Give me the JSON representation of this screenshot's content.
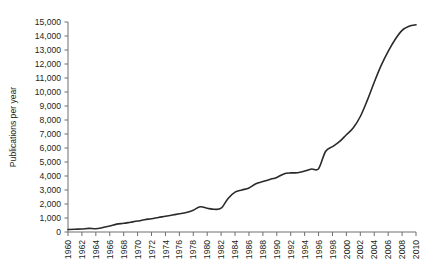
{
  "chart_data": {
    "type": "line",
    "title": "",
    "subtitle": "",
    "xlabel": "",
    "ylabel": "Publications per year",
    "xlim": [
      1960,
      2010
    ],
    "ylim": [
      0,
      15000
    ],
    "ytick_step": 1000,
    "xtick_step": 2,
    "grid": false,
    "legend": false,
    "legend_position": "none",
    "line_color": "#2a2a2a",
    "ytick_labels": [
      "0",
      "1,000",
      "2,000",
      "3,000",
      "4,000",
      "5,000",
      "6,000",
      "7,000",
      "8,000",
      "9,000",
      "10,000",
      "11,000",
      "12,000",
      "13,000",
      "14,000",
      "15,000"
    ],
    "xtick_labels": [
      "1960",
      "1962",
      "1964",
      "1966",
      "1968",
      "1970",
      "1972",
      "1974",
      "1976",
      "1978",
      "1980",
      "1982",
      "1984",
      "1986",
      "1988",
      "1990",
      "1992",
      "1994",
      "1996",
      "1998",
      "2000",
      "2002",
      "2004",
      "2006",
      "2008",
      "2010"
    ],
    "x": [
      1960,
      1961,
      1962,
      1963,
      1964,
      1965,
      1966,
      1967,
      1968,
      1969,
      1970,
      1971,
      1972,
      1973,
      1974,
      1975,
      1976,
      1977,
      1978,
      1979,
      1980,
      1981,
      1982,
      1983,
      1984,
      1985,
      1986,
      1987,
      1988,
      1989,
      1990,
      1991,
      1992,
      1993,
      1994,
      1995,
      1996,
      1997,
      1998,
      1999,
      2000,
      2001,
      2002,
      2003,
      2004,
      2005,
      2006,
      2007,
      2008,
      2009,
      2010
    ],
    "values": [
      180,
      200,
      210,
      260,
      230,
      320,
      430,
      560,
      620,
      700,
      780,
      880,
      950,
      1040,
      1120,
      1210,
      1300,
      1400,
      1560,
      1800,
      1700,
      1620,
      1700,
      2400,
      2850,
      3000,
      3150,
      3450,
      3600,
      3750,
      3900,
      4150,
      4220,
      4230,
      4350,
      4500,
      4520,
      5750,
      6100,
      6450,
      6950,
      7450,
      8250,
      9400,
      10700,
      11900,
      12900,
      13750,
      14400,
      14700,
      14800
    ],
    "series": [
      {
        "name": "Publications per year",
        "values": [
          180,
          200,
          210,
          260,
          230,
          320,
          430,
          560,
          620,
          700,
          780,
          880,
          950,
          1040,
          1120,
          1210,
          1300,
          1400,
          1560,
          1800,
          1700,
          1620,
          1700,
          2400,
          2850,
          3000,
          3150,
          3450,
          3600,
          3750,
          3900,
          4150,
          4220,
          4230,
          4350,
          4500,
          4520,
          5750,
          6100,
          6450,
          6950,
          7450,
          8250,
          9400,
          10700,
          11900,
          12900,
          13750,
          14400,
          14700,
          14800
        ]
      }
    ]
  }
}
